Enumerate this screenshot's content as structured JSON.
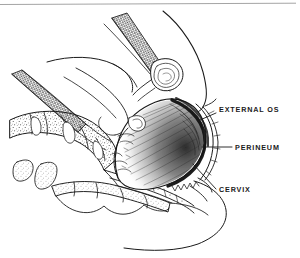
{
  "figure": {
    "background_color": "#ffffff",
    "ink_color": "#1a1a1a",
    "top_rule": {
      "present": true,
      "color": "#9a9a9a"
    },
    "labels": [
      {
        "id": "external-os",
        "text": "EXTERNAL OS",
        "text_x": 219,
        "text_y": 112,
        "leader": "M 216 113 L 200 120"
      },
      {
        "id": "perineum",
        "text": "PERINEUM",
        "text_x": 235,
        "text_y": 150,
        "leader": "M 232 147 L 202 147"
      },
      {
        "id": "cervix",
        "text": "CERVIX",
        "text_x": 219,
        "text_y": 192,
        "leader": "M 216 189 L 193 164"
      }
    ],
    "anatomy_parts": [
      "maternal-abdomen-outline",
      "abdominal-wall-hatched-band",
      "pubic-symphysis",
      "sacrum-vertebrae",
      "coccyx",
      "fetal-head",
      "fetal-hair-shading",
      "vaginal-canal",
      "perineum-body",
      "buttock-outline",
      "thigh-outline"
    ]
  }
}
